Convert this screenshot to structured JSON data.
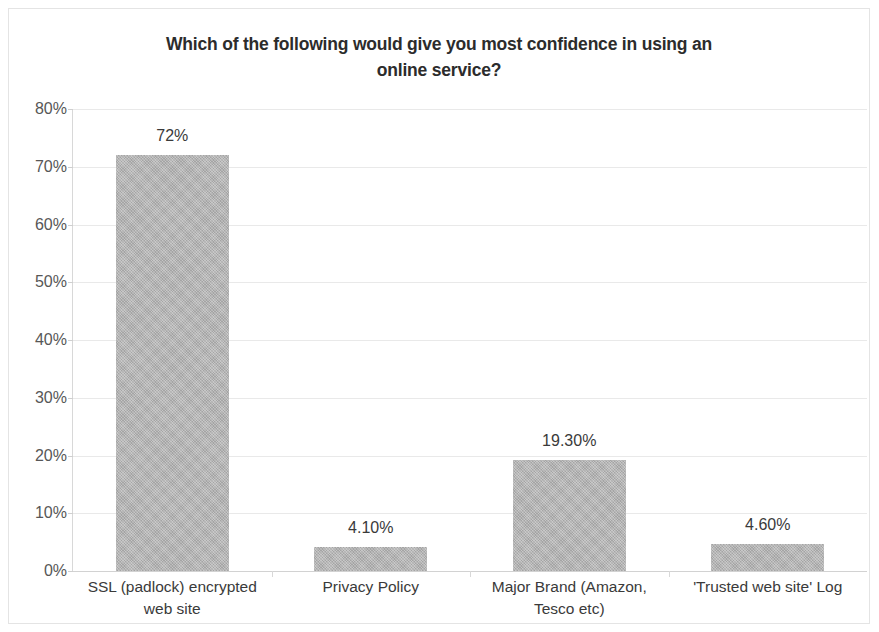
{
  "chart_data": {
    "type": "bar",
    "title": "Which of the following would give you most confidence in using an online service?",
    "title_line1": "Which of the following would give you most confidence in using an",
    "title_line2": "online service?",
    "xlabel": "",
    "ylabel": "",
    "ylim": [
      0,
      80
    ],
    "grid": true,
    "legend": "none",
    "categories": [
      "SSL (padlock) encrypted web site",
      "Privacy Policy",
      "Major Brand (Amazon, Tesco etc)",
      "'Trusted web site' Log"
    ],
    "category_lines": [
      [
        "SSL (padlock) encrypted",
        "web site"
      ],
      [
        "Privacy Policy",
        ""
      ],
      [
        "Major Brand (Amazon,",
        "Tesco etc)"
      ],
      [
        "'Trusted web site' Log",
        ""
      ]
    ],
    "values": [
      72,
      4.1,
      19.3,
      4.6
    ],
    "data_labels": [
      "72%",
      "4.10%",
      "19.30%",
      "4.60%"
    ],
    "y_ticks": [
      80,
      70,
      60,
      50,
      40,
      30,
      20,
      10,
      0
    ],
    "y_tick_labels": [
      "80%",
      "70%",
      "60%",
      "50%",
      "40%",
      "30%",
      "20%",
      "10%",
      "0%"
    ],
    "bar_color": "#b4b4b4",
    "grid_color": "#e9e9e9",
    "axis_color": "#d8d8d8",
    "text_color": "#3a3a3a",
    "background": "#ffffff"
  }
}
